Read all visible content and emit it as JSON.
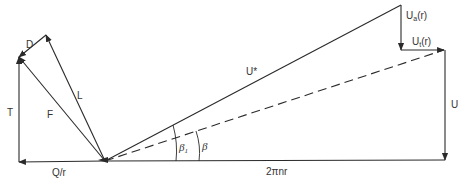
{
  "diagram": {
    "type": "velocity-and-force-triangle",
    "colors": {
      "stroke": "#2a2a2a",
      "text": "#333333",
      "background": "#ffffff"
    },
    "labels": {
      "D": "D",
      "L": "L",
      "F": "F",
      "T": "T",
      "Q_r": "Q/r",
      "U_star": "U*",
      "U_a": "U",
      "U_a_sub": "a",
      "U_a_arg": "(r)",
      "U_t": "U",
      "U_t_sub": "t",
      "U_t_arg": "(r)",
      "U": "U",
      "two_pi_nr": "2πnr",
      "beta_1": "β",
      "beta_1_sub": "1",
      "beta": "β"
    },
    "points": {
      "origin": [
        105,
        161
      ],
      "U_star_tip": [
        401,
        5
      ],
      "U_a_tip": [
        401,
        50
      ],
      "U_t_tip": [
        444,
        50
      ],
      "U_bottom": [
        445,
        160
      ],
      "Q_r_tip": [
        19,
        162
      ],
      "T_tip": [
        19,
        57
      ],
      "L_tip": [
        46,
        35
      ]
    },
    "vectors": [
      {
        "name": "U*",
        "from": "origin",
        "to": "U_star_tip",
        "style": "solid",
        "arrow": false
      },
      {
        "name": "Ua(r)",
        "from": "U_star_tip",
        "to": "U_a_tip",
        "style": "solid",
        "arrow": true
      },
      {
        "name": "Ut(r)",
        "from": "U_a_tip",
        "to": "U_t_tip",
        "style": "solid",
        "arrow": true
      },
      {
        "name": "dashed-resultant",
        "from": "origin",
        "to": "U_t_tip",
        "style": "dashed",
        "arrow": false
      },
      {
        "name": "U",
        "from": "U_t_tip",
        "to": "U_bottom",
        "style": "solid",
        "arrow": true
      },
      {
        "name": "2πnr",
        "from": "origin",
        "to": "U_bottom",
        "style": "solid",
        "arrow": false
      },
      {
        "name": "Q/r",
        "from": "origin",
        "to": "Q_r_tip",
        "style": "solid",
        "arrow": true
      },
      {
        "name": "T",
        "from": "Q_r_tip",
        "to": "T_tip",
        "style": "solid",
        "arrow": true
      },
      {
        "name": "F",
        "from": "origin",
        "to": "T_tip",
        "style": "solid",
        "arrow": true
      },
      {
        "name": "L",
        "from": "origin",
        "to": "L_tip",
        "style": "solid",
        "arrow": true
      },
      {
        "name": "D",
        "from": "L_tip",
        "to": "T_tip",
        "style": "solid",
        "arrow": true
      }
    ],
    "angles": [
      {
        "name": "β1",
        "between": [
          "U*",
          "2πnr"
        ]
      },
      {
        "name": "β",
        "between": [
          "dashed-resultant",
          "2πnr"
        ]
      }
    ]
  }
}
